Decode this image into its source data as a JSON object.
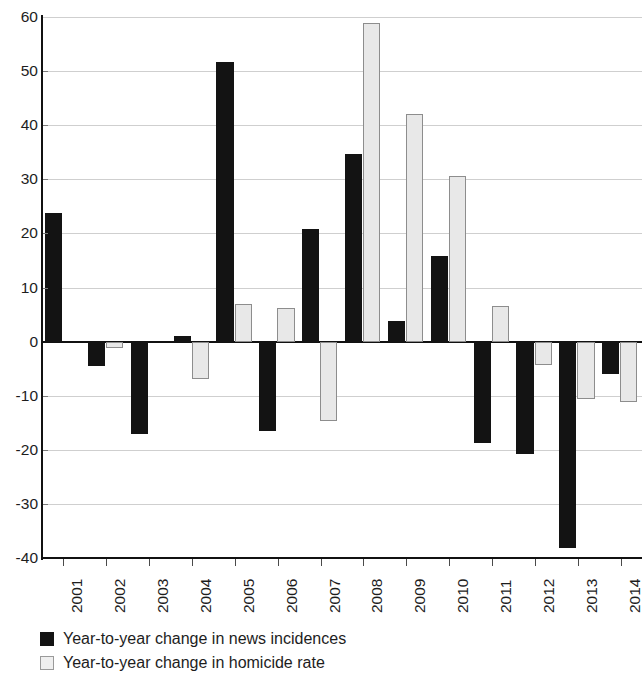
{
  "chart_data": {
    "type": "bar",
    "title": "",
    "subtitle": "",
    "xlabel": "",
    "ylabel": "",
    "ylim": [
      -40,
      60
    ],
    "ytick_step": 10,
    "grid": true,
    "legend_position": "bottom-left",
    "categories": [
      "2001",
      "2002",
      "2003",
      "2004",
      "2005",
      "2006",
      "2007",
      "2008",
      "2009",
      "2010",
      "2011",
      "2012",
      "2013",
      "2014"
    ],
    "yticks": [
      "60",
      "50",
      "40",
      "30",
      "20",
      "10",
      "0",
      "-10",
      "-20",
      "-30",
      "-40"
    ],
    "ytick_values": [
      60,
      50,
      40,
      30,
      20,
      10,
      0,
      -10,
      -20,
      -30,
      -40
    ],
    "series": [
      {
        "name": "Year-to-year change in news incidences",
        "color": "#131313",
        "values": [
          23.7,
          -4.6,
          -17.0,
          1.0,
          51.7,
          -16.5,
          20.9,
          34.6,
          3.9,
          15.8,
          -18.8,
          -20.8,
          -38.1,
          -6.0
        ]
      },
      {
        "name": "Year-to-year change in homicide rate",
        "color": "#e8e8e8",
        "values": [
          null,
          -1.1,
          null,
          -7.0,
          7.0,
          6.2,
          -14.6,
          58.8,
          42.0,
          30.7,
          6.6,
          -4.3,
          -10.6,
          -11.2
        ]
      }
    ]
  },
  "legend": {
    "items": [
      {
        "label": "Year-to-year change in news incidences",
        "swatch": "news"
      },
      {
        "label": "Year-to-year change in homicide rate",
        "swatch": "homicide"
      }
    ]
  }
}
